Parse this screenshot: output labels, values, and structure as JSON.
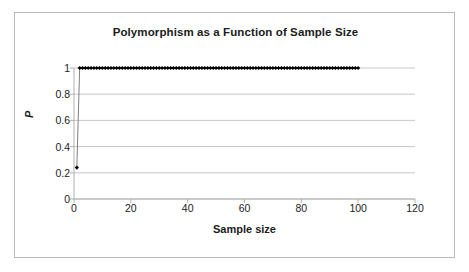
{
  "chart_data": {
    "type": "scatter",
    "title": "Polymorphism as a Function of Sample Size",
    "xlabel": "Sample size",
    "ylabel": "P",
    "xlim": [
      0,
      120
    ],
    "ylim": [
      0,
      1
    ],
    "xticks": [
      "0",
      "20",
      "40",
      "60",
      "80",
      "100",
      "120"
    ],
    "xtick_values": [
      0,
      20,
      40,
      60,
      80,
      100,
      120
    ],
    "yticks": [
      "0",
      "0.2",
      "0.4",
      "0.6",
      "0.8",
      "1"
    ],
    "ytick_values": [
      0,
      0.2,
      0.4,
      0.6,
      0.8,
      1
    ],
    "grid": "horizontal",
    "legend": "none",
    "marker": "diamond",
    "marker_color": "#000000",
    "line_color": "#808080",
    "series": [
      {
        "name": "P",
        "x": [
          1,
          2,
          3,
          4,
          5,
          6,
          7,
          8,
          9,
          10,
          11,
          12,
          13,
          14,
          15,
          16,
          17,
          18,
          19,
          20,
          21,
          22,
          23,
          24,
          25,
          26,
          27,
          28,
          29,
          30,
          31,
          32,
          33,
          34,
          35,
          36,
          37,
          38,
          39,
          40,
          41,
          42,
          43,
          44,
          45,
          46,
          47,
          48,
          49,
          50,
          51,
          52,
          53,
          54,
          55,
          56,
          57,
          58,
          59,
          60,
          61,
          62,
          63,
          64,
          65,
          66,
          67,
          68,
          69,
          70,
          71,
          72,
          73,
          74,
          75,
          76,
          77,
          78,
          79,
          80,
          81,
          82,
          83,
          84,
          85,
          86,
          87,
          88,
          89,
          90,
          91,
          92,
          93,
          94,
          95,
          96,
          97,
          98,
          99,
          100
        ],
        "y": [
          0.24,
          1,
          1,
          1,
          1,
          1,
          1,
          1,
          1,
          1,
          1,
          1,
          1,
          1,
          1,
          1,
          1,
          1,
          1,
          1,
          1,
          1,
          1,
          1,
          1,
          1,
          1,
          1,
          1,
          1,
          1,
          1,
          1,
          1,
          1,
          1,
          1,
          1,
          1,
          1,
          1,
          1,
          1,
          1,
          1,
          1,
          1,
          1,
          1,
          1,
          1,
          1,
          1,
          1,
          1,
          1,
          1,
          1,
          1,
          1,
          1,
          1,
          1,
          1,
          1,
          1,
          1,
          1,
          1,
          1,
          1,
          1,
          1,
          1,
          1,
          1,
          1,
          1,
          1,
          1,
          1,
          1,
          1,
          1,
          1,
          1,
          1,
          1,
          1,
          1,
          1,
          1,
          1,
          1,
          1,
          1,
          1,
          1,
          1,
          1
        ]
      }
    ]
  },
  "colors": {
    "frame_border": "#b9b9b9",
    "gridline": "#c9c9c9",
    "axis_line": "#b0b0b0",
    "text": "#1b1b1b",
    "background": "#ffffff"
  }
}
